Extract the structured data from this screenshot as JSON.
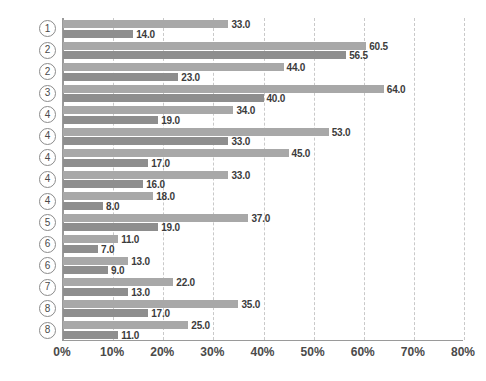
{
  "chart_data": {
    "type": "bar",
    "orientation": "horizontal",
    "title": "",
    "subtitle": "",
    "xlabel": "",
    "ylabel": "",
    "xlim": [
      0,
      80
    ],
    "xticks": [
      0,
      10,
      20,
      30,
      40,
      50,
      60,
      70,
      80
    ],
    "xticklabels": [
      "0%",
      "10%",
      "20%",
      "30%",
      "40%",
      "50%",
      "60%",
      "70%",
      "80%"
    ],
    "grid": "vertical-dashed",
    "legend": "none",
    "categories": [
      "1",
      "2",
      "2",
      "3",
      "4",
      "4",
      "4",
      "4",
      "4",
      "5",
      "6",
      "6",
      "7",
      "8",
      "8"
    ],
    "category_style": "circled-number",
    "series": [
      {
        "name": "series-a",
        "color": "#a8a8a8",
        "values": [
          33.0,
          60.5,
          44.0,
          64.0,
          34.0,
          53.0,
          45.0,
          33.0,
          18.0,
          37.0,
          11.0,
          13.0,
          22.0,
          35.0,
          25.0
        ],
        "labels": [
          "33.0",
          "60.5",
          "44.0",
          "64.0",
          "34.0",
          "53.0",
          "45.0",
          "33.0",
          "18.0",
          "37.0",
          "11.0",
          "13.0",
          "22.0",
          "35.0",
          "25.0"
        ]
      },
      {
        "name": "series-b",
        "color": "#8e8e8e",
        "values": [
          14.0,
          56.5,
          23.0,
          40.0,
          19.0,
          33.0,
          17.0,
          16.0,
          8.0,
          19.0,
          7.0,
          9.0,
          13.0,
          17.0,
          11.0
        ],
        "labels": [
          "14.0",
          "56.5",
          "23.0",
          "40.0",
          "19.0",
          "33.0",
          "17.0",
          "16.0",
          "8.0",
          "19.0",
          "7.0",
          "9.0",
          "13.0",
          "17.0",
          "11.0"
        ]
      }
    ]
  }
}
